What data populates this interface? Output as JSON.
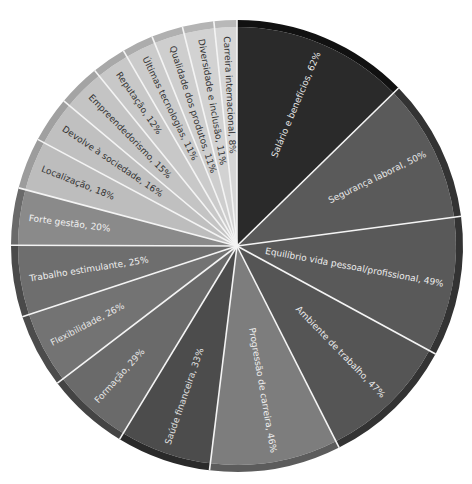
{
  "chart_data": {
    "type": "pie",
    "title": "",
    "categories": [
      "Salário e benefícios",
      "Segurança laboral",
      "Equilíbrio vida pessoal/profissional",
      "Ambiente de trabalho",
      "Progressão de carreira",
      "Saúde financeira",
      "Formação",
      "Flexibilidade",
      "Trabalho estimulante",
      "Forte gestão",
      "Localização",
      "Devolve à sociedade",
      "Empreendedorismo",
      "Reputação",
      "Últimas tecnologias",
      "Qualidade dos produtos",
      "Diversidade e inclusão",
      "Carreira internacional"
    ],
    "values": [
      62,
      50,
      49,
      47,
      46,
      33,
      29,
      26,
      25,
      20,
      18,
      16,
      15,
      12,
      11,
      11,
      11,
      8
    ],
    "unit": "%",
    "labels": [
      "Salário e benefícios, 62%",
      "Segurança laboral, 50%",
      "Equilíbrio vida pessoal/profissional, 49%",
      "Ambiente de trabalho, 47%",
      "Progressão de carreira, 46%",
      "Saúde financeira, 33%",
      "Formação, 29%",
      "Flexibilidade, 26%",
      "Trabalho estimulante, 25%",
      "Forte gestão, 20%",
      "Localização, 18%",
      "Devolve à sociedade, 16%",
      "Empreendedorismo, 15%",
      "Reputação, 12%",
      "Últimas tecnologias, 11%",
      "Qualidade dos produtos, 11%",
      "Diversidade e inclusão, 11%",
      "Carreira internacional, 8%"
    ],
    "colors": [
      "#2a2a2a",
      "#5a5a5a",
      "#595959",
      "#555555",
      "#7d7d7d",
      "#4c4c4c",
      "#6a6a6a",
      "#737373",
      "#6e6e6e",
      "#8a8a8a",
      "#bdbdbd",
      "#c0c0c0",
      "#c4c4c4",
      "#c8c8c8",
      "#cbcbcb",
      "#cecece",
      "#d2d2d2",
      "#d6d6d6"
    ],
    "rim_colors": [
      "#111111",
      "#333333",
      "#333333",
      "#333333",
      "#5c5c5c",
      "#2a2a2a",
      "#444444",
      "#4c4c4c",
      "#4a4a4a",
      "#6a6a6a",
      "#9c9c9c",
      "#a0a0a0",
      "#a4a4a4",
      "#a8a8a8",
      "#acacac",
      "#b0b0b0",
      "#b4b4b4",
      "#b8b8b8"
    ],
    "label_colors": [
      "#e8e8e8",
      "#e8e8e8",
      "#eeeeee",
      "#e8e8e8",
      "#eeeeee",
      "#e0e0e0",
      "#e6e6e6",
      "#e6e6e6",
      "#eeeeee",
      "#f2f2f2",
      "#333333",
      "#333333",
      "#333333",
      "#333333",
      "#333333",
      "#333333",
      "#333333",
      "#333333"
    ],
    "start_angle_deg": 0,
    "direction": "clockwise",
    "legend": "none"
  }
}
